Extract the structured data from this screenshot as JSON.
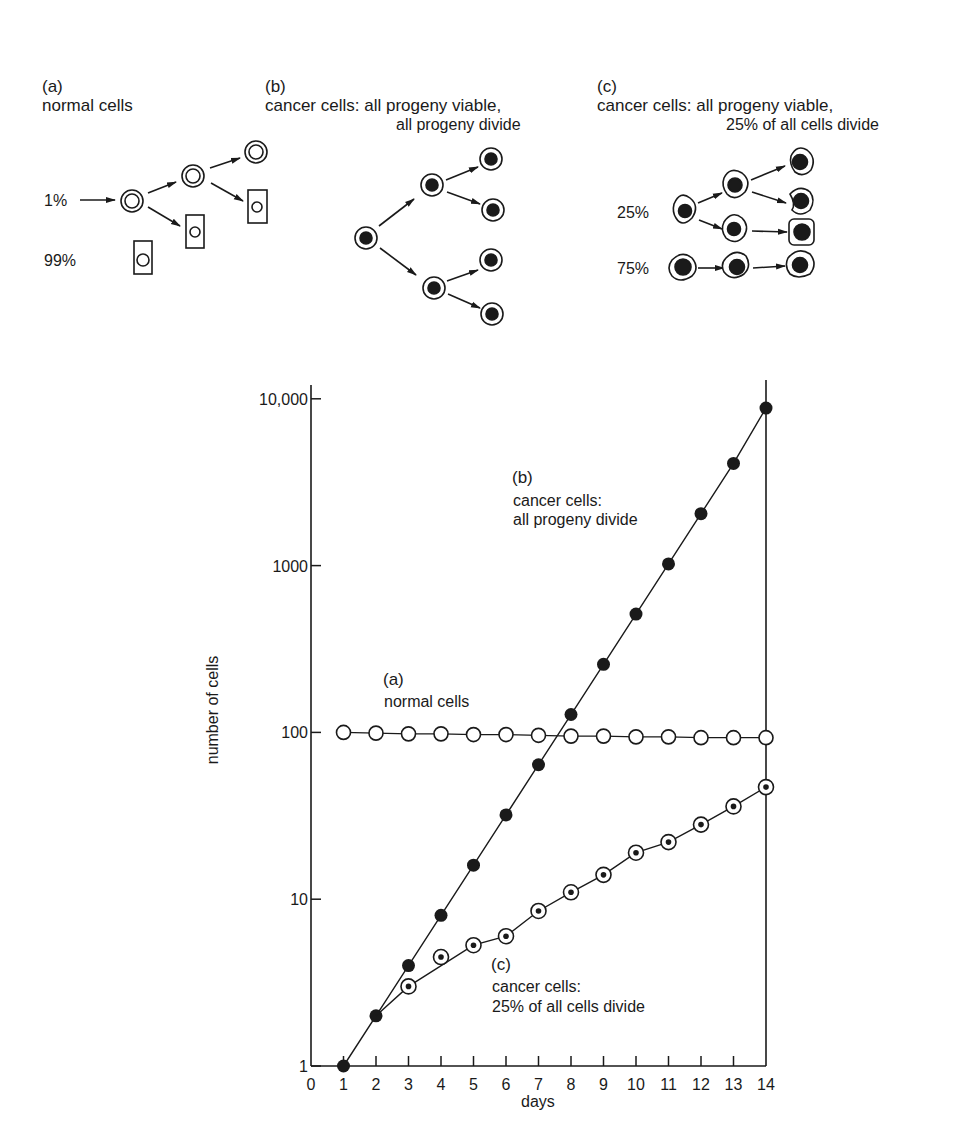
{
  "panels": {
    "a": {
      "letter": "(a)",
      "title": "normal cells",
      "pct_top": "1%",
      "pct_bottom": "99%"
    },
    "b": {
      "letter": "(b)",
      "title_line1": "cancer cells: all progeny viable,",
      "title_line2": "all progeny divide"
    },
    "c": {
      "letter": "(c)",
      "title_line1": "cancer cells: all progeny viable,",
      "title_line2": "25% of all cells divide",
      "pct_top": "25%",
      "pct_bottom": "75%"
    }
  },
  "chart_labels": {
    "b_letter": "(b)",
    "b_line1": "cancer cells:",
    "b_line2": "all progeny divide",
    "a_letter": "(a)",
    "a_line1": "normal cells",
    "c_letter": "(c)",
    "c_line1": "cancer cells:",
    "c_line2": "25% of all cells divide"
  },
  "chart_data": {
    "type": "line",
    "title": "",
    "xlabel": "days",
    "ylabel": "number of cells",
    "yscale": "log",
    "xlim": [
      0,
      14
    ],
    "ylim": [
      1,
      10000
    ],
    "x_ticks": [
      "0",
      "1",
      "2",
      "3",
      "4",
      "5",
      "6",
      "7",
      "8",
      "9",
      "10",
      "11",
      "12",
      "13",
      "14"
    ],
    "y_ticks": [
      "1",
      "10",
      "100",
      "1000",
      "10,000"
    ],
    "grid": false,
    "legend": "inline annotations",
    "x": [
      1,
      2,
      3,
      4,
      5,
      6,
      7,
      8,
      9,
      10,
      11,
      12,
      13,
      14
    ],
    "series": [
      {
        "name": "(a) normal cells",
        "marker": "open-circle",
        "x": [
          1,
          2,
          3,
          4,
          5,
          6,
          7,
          8,
          9,
          10,
          11,
          12,
          13,
          14
        ],
        "values": [
          100,
          99,
          98,
          98,
          97,
          97,
          96,
          95,
          95,
          94,
          94,
          93,
          93,
          93
        ]
      },
      {
        "name": "(b) cancer cells: all progeny divide",
        "marker": "filled-circle",
        "x": [
          1,
          2,
          3,
          4,
          5,
          6,
          7,
          8,
          9,
          10,
          11,
          12,
          13,
          14
        ],
        "values": [
          1,
          2,
          4,
          8,
          16,
          32,
          64,
          128,
          256,
          512,
          1024,
          2048,
          4096,
          8800
        ]
      },
      {
        "name": "(c) cancer cells: 25% of all cells divide",
        "marker": "dotted-circle",
        "x": [
          2,
          3,
          4,
          5,
          6,
          7,
          8,
          9,
          10,
          11,
          12,
          13,
          14
        ],
        "values": [
          2,
          3,
          4.5,
          5.3,
          6,
          8.5,
          11,
          14,
          19,
          22,
          28,
          36,
          47
        ]
      }
    ]
  }
}
